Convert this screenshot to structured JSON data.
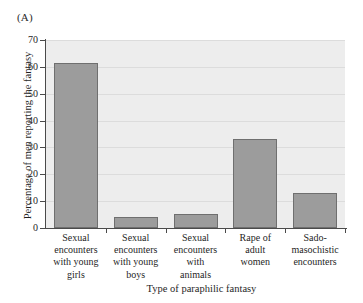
{
  "panel": {
    "label": "(A)"
  },
  "chart_data": {
    "type": "bar",
    "title": "",
    "subtitle": "",
    "xlabel": "Type of paraphilic fantasy",
    "ylabel": "Percentage of men reporting the fantasy",
    "categories": [
      "Sexual encounters with young girls",
      "Sexual encounters with young boys",
      "Sexual encounters with animals",
      "Rape of adult women",
      "Sado-masochistic encounters"
    ],
    "category_lines": [
      [
        "Sexual",
        "encounters",
        "with young",
        "girls"
      ],
      [
        "Sexual",
        "encounters",
        "with young",
        "boys"
      ],
      [
        "Sexual",
        "encounters",
        "with",
        "animals"
      ],
      [
        "Rape of",
        "adult",
        "women"
      ],
      [
        "Sado-",
        "masochistic",
        "encounters"
      ]
    ],
    "values": [
      61.5,
      4.0,
      5.2,
      33.2,
      13.1
    ],
    "ylim": [
      0,
      70
    ],
    "ytick_labels": [
      "0",
      "10",
      "20",
      "30",
      "40",
      "50",
      "60",
      "70"
    ],
    "ytick_values": [
      0,
      10,
      20,
      30,
      40,
      50,
      60,
      70
    ],
    "grid": true,
    "grid_orientation": "horizontal",
    "legend": false,
    "legend_position": "none",
    "bar_color": "#9c9c9c",
    "bar_edge_color": "#6f6f6f",
    "plot_background": "#ededed",
    "gridline_color": "#dcdcdc",
    "axis_color": "#4a4a4a"
  }
}
